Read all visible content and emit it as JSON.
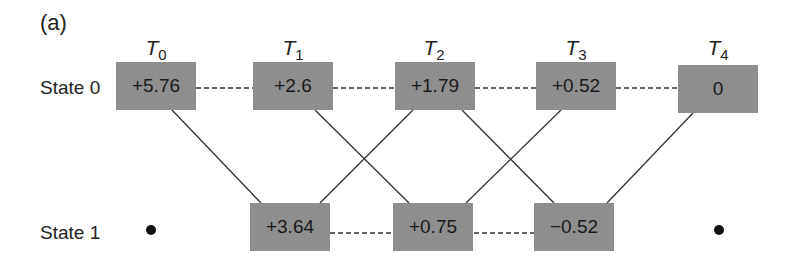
{
  "panel_label": "(a)",
  "time_steps": [
    {
      "label": "T",
      "sub": "0"
    },
    {
      "label": "T",
      "sub": "1"
    },
    {
      "label": "T",
      "sub": "2"
    },
    {
      "label": "T",
      "sub": "3"
    },
    {
      "label": "T",
      "sub": "4"
    }
  ],
  "states": [
    {
      "label": "State 0",
      "values": [
        "+5.76",
        "+2.6",
        "+1.79",
        "+0.52",
        "0"
      ]
    },
    {
      "label": "State 1",
      "values": [
        null,
        "+3.64",
        "+0.75",
        "−0.52",
        null
      ]
    }
  ],
  "colors": {
    "box_fill": "#8e8e8e",
    "line": "#333333",
    "background": "#ffffff"
  },
  "edges": {
    "dashed": [
      [
        "s0t0",
        "s0t1"
      ],
      [
        "s0t1",
        "s0t2"
      ],
      [
        "s0t2",
        "s0t3"
      ],
      [
        "s0t3",
        "s0t4"
      ],
      [
        "s1t1",
        "s1t2"
      ],
      [
        "s1t2",
        "s1t3"
      ]
    ],
    "solid": [
      [
        "s0t0",
        "s1t1"
      ],
      [
        "s0t1",
        "s1t2"
      ],
      [
        "s1t1",
        "s0t2"
      ],
      [
        "s0t2",
        "s1t3"
      ],
      [
        "s1t2",
        "s0t3"
      ],
      [
        "s1t3",
        "s0t4"
      ]
    ]
  }
}
